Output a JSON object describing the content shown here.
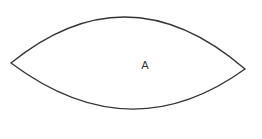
{
  "diagram": {
    "shape": "lens",
    "stroke_color": "#333333",
    "fill_color": "#ffffff",
    "background": "#ffffff",
    "label": {
      "text": "A",
      "x": 145,
      "y": 65
    },
    "points": {
      "left": [
        11,
        63
      ],
      "right": [
        245,
        69
      ],
      "top_control": [
        128,
        -32
      ],
      "bottom_control": [
        130,
        152
      ]
    }
  }
}
